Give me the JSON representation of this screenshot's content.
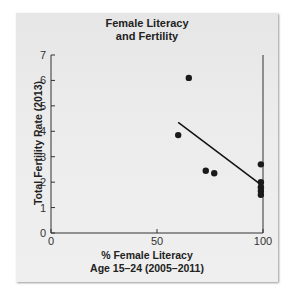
{
  "chart_data": {
    "type": "scatter",
    "title": "Female Literacy and Fertility",
    "title_lines": [
      "Female Literacy",
      "and Fertility"
    ],
    "xlabel": "% Female Literacy Age 15–24 (2005–2011)",
    "xlabel_lines": [
      "% Female Literacy",
      "Age 15–24 (2005–2011)"
    ],
    "ylabel": "Total Fertility Rate (2013)",
    "xlim": [
      0,
      100
    ],
    "ylim": [
      0,
      7
    ],
    "xticks": [
      0,
      50,
      100
    ],
    "yticks": [
      0,
      1,
      2,
      3,
      4,
      5,
      6,
      7
    ],
    "grid": false,
    "points": [
      {
        "x": 65,
        "y": 6.1
      },
      {
        "x": 60,
        "y": 3.85
      },
      {
        "x": 73,
        "y": 2.45
      },
      {
        "x": 77,
        "y": 2.35
      },
      {
        "x": 99,
        "y": 2.7
      },
      {
        "x": 99,
        "y": 2.0
      },
      {
        "x": 99,
        "y": 1.8
      },
      {
        "x": 99,
        "y": 1.65
      },
      {
        "x": 99,
        "y": 1.5
      }
    ],
    "trendline": {
      "x": [
        60,
        99
      ],
      "y": [
        4.35,
        1.9
      ]
    }
  }
}
